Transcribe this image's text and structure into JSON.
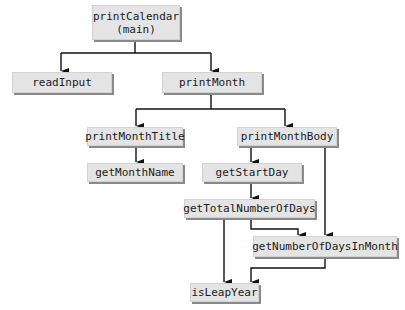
{
  "diagram": {
    "type": "structure-chart",
    "nodes": {
      "printCalendar": "printCalendar\n(main)",
      "readInput": "readInput",
      "printMonth": "printMonth",
      "printMonthTitle": "printMonthTitle",
      "printMonthBody": "printMonthBody",
      "getMonthName": "getMonthName",
      "getStartDay": "getStartDay",
      "getTotalNumberOfDays": "getTotalNumberOfDays",
      "getNumberOfDaysInMonth": "getNumberOfDaysInMonth",
      "isLeapYear": "isLeapYear"
    },
    "edges": [
      [
        "printCalendar",
        "readInput"
      ],
      [
        "printCalendar",
        "printMonth"
      ],
      [
        "printMonth",
        "printMonthTitle"
      ],
      [
        "printMonth",
        "printMonthBody"
      ],
      [
        "printMonthTitle",
        "getMonthName"
      ],
      [
        "printMonthBody",
        "getStartDay"
      ],
      [
        "printMonthBody",
        "getNumberOfDaysInMonth"
      ],
      [
        "getStartDay",
        "getTotalNumberOfDays"
      ],
      [
        "getTotalNumberOfDays",
        "getNumberOfDaysInMonth"
      ],
      [
        "getTotalNumberOfDays",
        "isLeapYear"
      ],
      [
        "getNumberOfDaysInMonth",
        "isLeapYear"
      ]
    ],
    "colors": {
      "box_fill": "#e4e4e4",
      "box_shadow": "#8a8a8a",
      "line": "#111111"
    }
  }
}
